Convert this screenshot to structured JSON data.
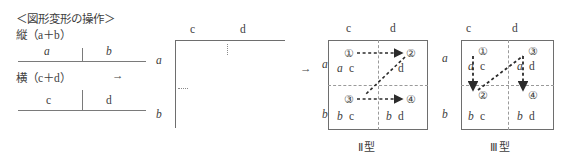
{
  "left_panel": {
    "heading": "＜図形変形の操作＞",
    "vertical_row": {
      "label": "縦（a＋b）",
      "segments": [
        {
          "text": "a",
          "italic": true
        },
        {
          "text": "b",
          "italic": true
        }
      ]
    },
    "horizontal_row": {
      "label": "横（c＋d）",
      "arrow": "→",
      "segments": [
        {
          "text": "c",
          "italic": false
        },
        {
          "text": "d",
          "italic": false
        }
      ]
    }
  },
  "middle_diagram": {
    "col_labels": [
      "c",
      "d"
    ],
    "row_labels": [
      "a",
      "b"
    ],
    "transform_arrow": "→"
  },
  "boxes": [
    {
      "caption": "Ⅱ型",
      "col_labels": [
        "c",
        "d"
      ],
      "row_labels": [
        "a",
        "b"
      ],
      "cells": [
        {
          "order": "①",
          "row": "a",
          "col": "c"
        },
        {
          "order": "②",
          "row": "",
          "col": "d"
        },
        {
          "order": "③",
          "row": "b",
          "col": "c"
        },
        {
          "order": "④",
          "row": "b",
          "col": "d"
        }
      ],
      "path_order": [
        "①",
        "②",
        "③",
        "④"
      ],
      "path_style": "dotted"
    },
    {
      "caption": "Ⅲ型",
      "col_labels": [
        "c",
        "d"
      ],
      "row_labels": [
        "a",
        "b"
      ],
      "cells": [
        {
          "order": "①",
          "row": "a",
          "col": "c"
        },
        {
          "order": "②",
          "row": "b",
          "col": "c"
        },
        {
          "order": "③",
          "row": "a",
          "col": "d"
        },
        {
          "order": "④",
          "row": "b",
          "col": "d"
        }
      ],
      "path_order": [
        "①",
        "②",
        "③",
        "④"
      ],
      "path_style": "dotted"
    }
  ],
  "colors": {
    "ink": "#3d3d3d",
    "rule": "#6e6e6e",
    "dash": "#9a9a9a"
  }
}
